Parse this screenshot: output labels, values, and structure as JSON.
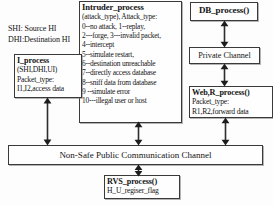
{
  "diagram": {
    "stroke_color": "#3a3a3a",
    "background_color": "#fdfdfd",
    "text_color": "#141414"
  },
  "legend": {
    "line1": "SHI: Source HI",
    "line2": "DHI:Destination HI"
  },
  "intruder": {
    "title": "Intruder_process",
    "lines": [
      "(attack_type), Attack_type:",
      "0--no attack, 1--replay,",
      "2---forge, 3---invalid packet,",
      "4--intercept",
      "5--simulate restart,",
      "6--destination unreachable",
      "7--directly access database",
      "8--sniff data from database",
      "9 --simulate error",
      "10---illegal user or host"
    ]
  },
  "i_process": {
    "title": "I_process",
    "lines": [
      "(SHI,DHI,UI)",
      "Packet_type:",
      "I1,I2,access data"
    ]
  },
  "db_process": {
    "title": "DB_process()"
  },
  "private_channel": {
    "label": "Private Channel"
  },
  "web_r_process": {
    "title": "Web,R_process()",
    "lines": [
      "Packet_type:",
      "R1,R2,forward data"
    ]
  },
  "public_channel": {
    "label": "Non-Safe Public Communication Channel"
  },
  "rvs_process": {
    "title": "RVS_process()",
    "lines": [
      "H_U_regiser_flag"
    ]
  },
  "connectors": [
    {
      "name": "db-to-private-channel",
      "kind": "double-arrow-vertical"
    },
    {
      "name": "private-channel-to-web",
      "kind": "double-arrow-vertical"
    },
    {
      "name": "i-process-to-public-channel",
      "kind": "double-arrow-vertical"
    },
    {
      "name": "intruder-to-public-channel",
      "kind": "double-arrow-vertical"
    },
    {
      "name": "web-to-public-channel",
      "kind": "double-arrow-vertical"
    },
    {
      "name": "rvs-to-public-channel",
      "kind": "double-arrow-vertical"
    }
  ]
}
